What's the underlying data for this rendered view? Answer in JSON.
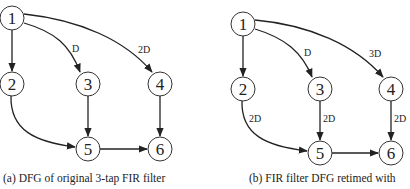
{
  "panels": [
    {
      "id": "a",
      "caption": "(a) DFG of original 3-tap FIR filter",
      "nodes": [
        {
          "id": "1",
          "label": "1"
        },
        {
          "id": "2",
          "label": "2"
        },
        {
          "id": "3",
          "label": "3"
        },
        {
          "id": "4",
          "label": "4"
        },
        {
          "id": "5",
          "label": "5"
        },
        {
          "id": "6",
          "label": "6"
        }
      ],
      "edges": [
        {
          "from": "1",
          "to": "2",
          "label": ""
        },
        {
          "from": "1",
          "to": "3",
          "label": "D"
        },
        {
          "from": "1",
          "to": "4",
          "label": "2D"
        },
        {
          "from": "2",
          "to": "5",
          "label": ""
        },
        {
          "from": "3",
          "to": "5",
          "label": ""
        },
        {
          "from": "4",
          "to": "6",
          "label": ""
        },
        {
          "from": "5",
          "to": "6",
          "label": ""
        }
      ]
    },
    {
      "id": "b",
      "caption": "(b) FIR filter DFG retimed with",
      "nodes": [
        {
          "id": "1",
          "label": "1"
        },
        {
          "id": "2",
          "label": "2"
        },
        {
          "id": "3",
          "label": "3"
        },
        {
          "id": "4",
          "label": "4"
        },
        {
          "id": "5",
          "label": "5"
        },
        {
          "id": "6",
          "label": "6"
        }
      ],
      "edges": [
        {
          "from": "1",
          "to": "2",
          "label": ""
        },
        {
          "from": "1",
          "to": "3",
          "label": "D"
        },
        {
          "from": "1",
          "to": "4",
          "label": "3D"
        },
        {
          "from": "2",
          "to": "5",
          "label": "2D"
        },
        {
          "from": "3",
          "to": "5",
          "label": "2D"
        },
        {
          "from": "4",
          "to": "6",
          "label": "2D"
        },
        {
          "from": "5",
          "to": "6",
          "label": ""
        }
      ]
    }
  ]
}
